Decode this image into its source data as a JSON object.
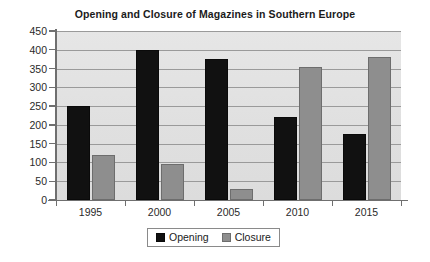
{
  "chart_data": {
    "type": "bar",
    "title": "Opening and Closure of Magazines in Southern Europe",
    "xlabel": "",
    "ylabel": "",
    "categories": [
      "1995",
      "2000",
      "2005",
      "2010",
      "2015"
    ],
    "series": [
      {
        "name": "Opening",
        "color": "#111111",
        "values": [
          250,
          400,
          375,
          220,
          175
        ]
      },
      {
        "name": "Closure",
        "color": "#8e8e8e",
        "values": [
          120,
          95,
          30,
          355,
          380
        ]
      }
    ],
    "ylim": [
      0,
      450
    ],
    "ytick_step": 50,
    "ytick_labels": [
      "0",
      "50",
      "100",
      "150",
      "200",
      "250",
      "300",
      "350",
      "400",
      "450"
    ],
    "grid": true,
    "legend_position": "bottom-center"
  },
  "legend": {
    "entries": [
      {
        "label": "Opening",
        "swatch": "opening"
      },
      {
        "label": "Closure",
        "swatch": "closure"
      }
    ]
  }
}
